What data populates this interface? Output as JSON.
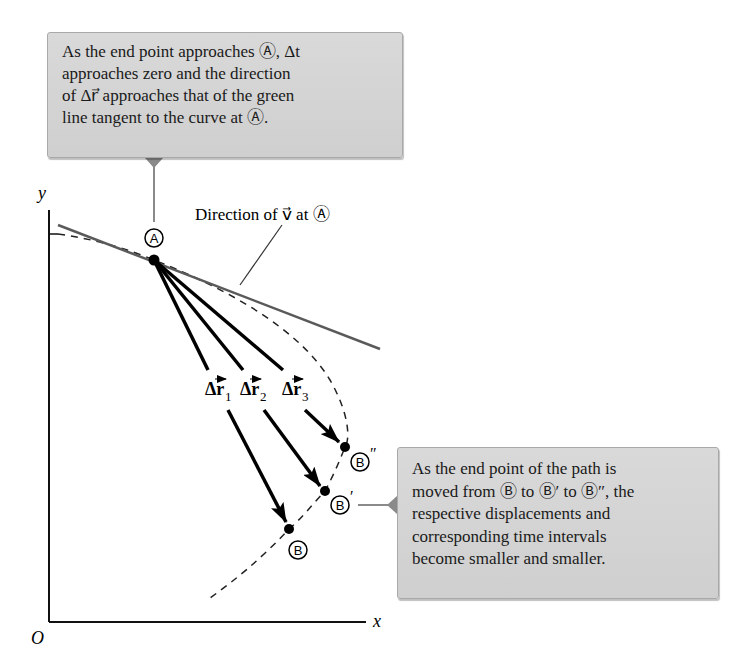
{
  "callout_top": {
    "lines": [
      "As the end point approaches Ⓐ, Δt",
      "approaches zero and the direction",
      "of Δr⃗ approaches that of the green",
      "line tangent to the curve at Ⓐ."
    ]
  },
  "callout_right": {
    "lines": [
      "As the end point of the path is",
      "moved from Ⓑ to Ⓑ′ to Ⓑ″, the",
      "respective displacements and",
      "corresponding time intervals",
      "become smaller and smaller."
    ]
  },
  "diagram": {
    "axis_x_label": "x",
    "axis_y_label": "y",
    "origin_label": "O",
    "tangent_label": "Direction of v⃗ at Ⓐ",
    "point_a_label": "A",
    "point_b_label": "B",
    "point_b1_label": "B",
    "point_b1_prime": "′",
    "point_b2_label": "B",
    "point_b2_prime": "″",
    "dr1_label": "Δr",
    "dr1_sub": "1",
    "dr2_label": "Δr",
    "dr2_sub": "2",
    "dr3_label": "Δr",
    "dr3_sub": "3",
    "colors": {
      "callout_bg": "#d4d4d4",
      "callout_border": "#a9a9a9",
      "tangent_line": "#5a5a5a",
      "leader_line": "#8a8a8a",
      "vectors": "#000000"
    }
  }
}
